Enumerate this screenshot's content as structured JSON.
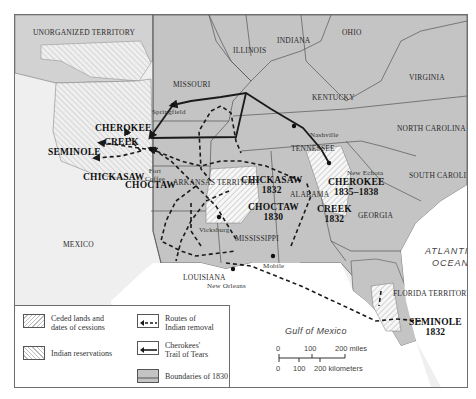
{
  "map": {
    "territories": {
      "unorganized": "UNORGANIZED TERRITORY",
      "arkansas": "ARKANSAS TERRITORY",
      "florida": "FLORIDA TERRITORY",
      "mexico": "MEXICO"
    },
    "states": {
      "illinois": "ILLINOIS",
      "indiana": "INDIANA",
      "ohio": "OHIO",
      "missouri": "MISSOURI",
      "kentucky": "KENTUCKY",
      "virginia": "VIRGINIA",
      "north_carolina": "NORTH CAROLINA",
      "tennessee": "TENNESSEE",
      "south_carolina": "SOUTH CAROLINA",
      "georgia": "GEORGIA",
      "alabama": "ALABAMA",
      "mississippi": "MISSISSIPPI",
      "louisiana": "LOUISIANA"
    },
    "cities": {
      "springfield": "Springfield",
      "nashville": "Nashville",
      "new_echota": "New Echota",
      "fort_coffee": "Fort Coffee",
      "vicksburg": "Vicksburg",
      "mobile": "Mobile",
      "new_orleans": "New Orleans"
    },
    "reservations": {
      "cherokee": "CHEROKEE",
      "creek": "CREEK",
      "seminole": "SEMINOLE",
      "chickasaw": "CHICKASAW",
      "choctaw": "CHOCTAW"
    },
    "cessions": {
      "chickasaw": {
        "name": "CHICKASAW",
        "year": "1832"
      },
      "choctaw": {
        "name": "CHOCTAW",
        "year": "1830"
      },
      "cherokee": {
        "name": "CHEROKEE",
        "year": "1835–1838"
      },
      "creek": {
        "name": "CREEK",
        "year": "1832"
      },
      "seminole": {
        "name": "SEMINOLE",
        "year": "1832"
      }
    },
    "water": {
      "atlantic_line1": "ATLANTIC",
      "atlantic_line2": "OCEAN",
      "gulf": "Gulf of Mexico"
    },
    "colors": {
      "us_state_fill": "#c4c4c4",
      "territory_fill": "#d2d2d2",
      "foreign_fill": "#efefef",
      "water": "#ffffff",
      "boundary": "#555555",
      "route": "#1a1a1a"
    }
  },
  "legend": {
    "ceded_line1": "Ceded lands and",
    "ceded_line2": "dates of cessions",
    "reservations": "Indian reservations",
    "routes_line1": "Routes of",
    "routes_line2": "Indian removal",
    "trail_line1": "Cherokees'",
    "trail_line2": "Trail of Tears",
    "boundaries": "Boundaries of 1830"
  },
  "scale": {
    "miles": [
      "0",
      "100",
      "200 miles"
    ],
    "kilometers": [
      "0",
      "100",
      "200 kilometers"
    ]
  }
}
